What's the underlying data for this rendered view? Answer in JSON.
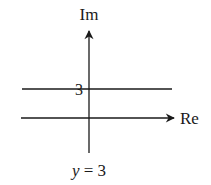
{
  "diagram": {
    "type": "complex-plane",
    "axes": {
      "imaginary_label": "Im",
      "real_label": "Re"
    },
    "line": {
      "equation": "y = 3",
      "equation_var": "y",
      "equation_rest": " = 3",
      "intercept_label": "3"
    },
    "colors": {
      "ink": "#1a1a1a",
      "background": "#ffffff"
    }
  }
}
